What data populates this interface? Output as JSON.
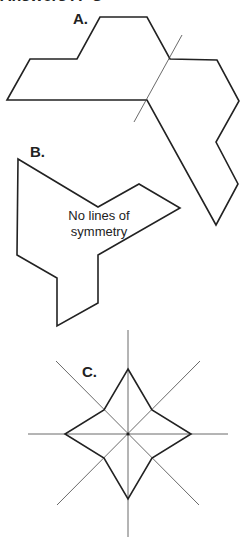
{
  "header": {
    "text": "Answers A–C"
  },
  "figures": [
    {
      "id": "A",
      "label": "A.",
      "symmetry_lines": 1,
      "note": ""
    },
    {
      "id": "B",
      "label": "B.",
      "symmetry_lines": 0,
      "note_line1": "No lines of",
      "note_line2": "symmetry"
    },
    {
      "id": "C",
      "label": "C.",
      "symmetry_lines": 4,
      "note": ""
    }
  ]
}
